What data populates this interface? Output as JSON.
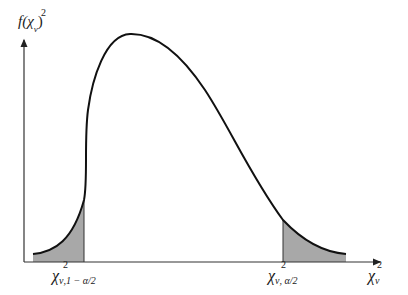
{
  "diagram": {
    "type": "chi-square distribution density with two-tailed rejection regions",
    "y_axis_label": {
      "func": "f(",
      "chi": "χ",
      "sup": "2",
      "sub": "ν",
      "close": ")"
    },
    "x_axis_label": {
      "chi": "χ",
      "sup": "2",
      "sub": "ν"
    },
    "lower_critical_label": {
      "chi": "χ",
      "sup": "2",
      "sub": "ν,1 − α/2"
    },
    "upper_critical_label": {
      "chi": "χ",
      "sup": "2",
      "sub": "ν, α/2"
    },
    "colors": {
      "curve": "#111111",
      "shade": "#a8a8a8",
      "axis": "#333333"
    }
  }
}
